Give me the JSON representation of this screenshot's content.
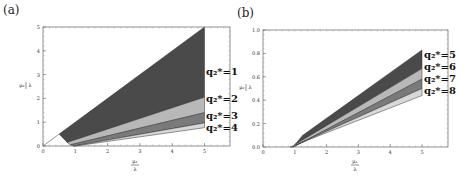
{
  "panels": [
    {
      "label": "(a)"
    },
    {
      "label": "(b)"
    }
  ],
  "chart_data": [
    {
      "type": "area",
      "title": "(a)",
      "xlabel": "μ1/λ",
      "ylabel": "μ2/λ",
      "xlim": [
        0,
        5.8
      ],
      "ylim": [
        0,
        5
      ],
      "xticks": [
        0,
        1,
        2,
        3,
        4,
        5
      ],
      "yticks": [
        0,
        1,
        2,
        3,
        4,
        5
      ],
      "grid": false,
      "regions": [
        {
          "name": "q2*=1",
          "shade": "#4a4a4a",
          "polygon": [
            [
              0.5,
              0.5
            ],
            [
              5,
              5
            ],
            [
              5,
              2.05
            ],
            [
              0.75,
              0.15
            ]
          ]
        },
        {
          "name": "q2*=2",
          "shade": "#b8b8b8",
          "polygon": [
            [
              0.75,
              0.15
            ],
            [
              5,
              2.05
            ],
            [
              5,
              1.4
            ],
            [
              0.85,
              0.05
            ]
          ]
        },
        {
          "name": "q2*=3",
          "shade": "#7a7a7a",
          "polygon": [
            [
              0.85,
              0.05
            ],
            [
              5,
              1.4
            ],
            [
              5,
              0.97
            ],
            [
              0.95,
              0.0
            ]
          ]
        },
        {
          "name": "q2*=4",
          "shade": "#d8d8d8",
          "polygon": [
            [
              0.95,
              0.0
            ],
            [
              5,
              0.97
            ],
            [
              5,
              0.77
            ],
            [
              1.0,
              0.0
            ]
          ]
        }
      ],
      "lines": [
        {
          "from": [
            0,
            0
          ],
          "to": [
            0.5,
            0.5
          ]
        }
      ],
      "annotations": [
        "q2*=1",
        "q2*=2",
        "q2*=3",
        "q2*=4"
      ]
    },
    {
      "type": "area",
      "title": "(b)",
      "xlabel": "μ1/λ",
      "ylabel": "μ2/λ",
      "xlim": [
        0,
        5.8
      ],
      "ylim": [
        0,
        1.0
      ],
      "xticks": [
        0,
        1,
        2,
        3,
        4,
        5
      ],
      "yticks": [
        0.0,
        0.2,
        0.4,
        0.6,
        0.8,
        1.0
      ],
      "grid": false,
      "regions": [
        {
          "name": "q2*=5",
          "shade": "#4a4a4a",
          "polygon": [
            [
              1.25,
              0.1
            ],
            [
              5,
              0.83
            ],
            [
              5,
              0.67
            ],
            [
              1.0,
              0.02
            ]
          ]
        },
        {
          "name": "q2*=6",
          "shade": "#b8b8b8",
          "polygon": [
            [
              1.0,
              0.02
            ],
            [
              5,
              0.67
            ],
            [
              5,
              0.58
            ],
            [
              0.95,
              0.0
            ]
          ]
        },
        {
          "name": "q2*=7",
          "shade": "#7a7a7a",
          "polygon": [
            [
              0.95,
              0.0
            ],
            [
              5,
              0.58
            ],
            [
              5,
              0.5
            ],
            [
              0.9,
              0.0
            ]
          ]
        },
        {
          "name": "q2*=8",
          "shade": "#d8d8d8",
          "polygon": [
            [
              0.9,
              0.0
            ],
            [
              5,
              0.5
            ],
            [
              5,
              0.44
            ],
            [
              0.85,
              0.0
            ]
          ]
        }
      ],
      "annotations": [
        "q2*=5",
        "q2*=6",
        "q2*=7",
        "q2*=8"
      ]
    }
  ],
  "ticks": {
    "a_x": [
      "0",
      "1",
      "2",
      "3",
      "4",
      "5"
    ],
    "a_y": [
      "0",
      "1",
      "2",
      "3",
      "4",
      "5"
    ],
    "b_x": [
      "0",
      "1",
      "2",
      "3",
      "4",
      "5"
    ],
    "b_y": [
      "0.0",
      "0.2",
      "0.4",
      "0.6",
      "0.8",
      "1.0"
    ]
  },
  "axis_labels": {
    "x_num": "μ₁",
    "y_num": "μ₂",
    "den": "λ"
  },
  "annotations_a": [
    "q₂*=1",
    "q₂*=2",
    "q₂*=3",
    "q₂*=4"
  ],
  "annotations_b": [
    "q₂*=5",
    "q₂*=6",
    "q₂*=7",
    "q₂*=8"
  ]
}
